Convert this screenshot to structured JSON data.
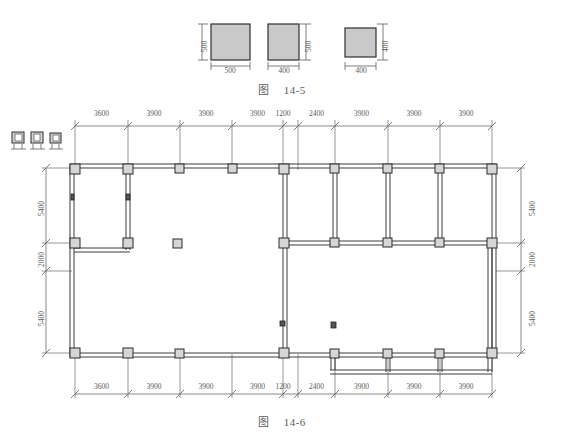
{
  "figures": [
    {
      "id": "fig-14-5",
      "caption_label": "图",
      "caption_number": "14-5",
      "squares": [
        {
          "name": "column-500x500",
          "width_label": "500",
          "height_label": "500"
        },
        {
          "name": "column-400x500",
          "width_label": "400",
          "height_label": "500"
        },
        {
          "name": "column-400x400",
          "width_label": "400",
          "height_label": "400"
        }
      ],
      "fill_color": "#c9c9c9",
      "stroke_color": "#2f2f2f"
    },
    {
      "id": "fig-14-6",
      "caption_label": "图",
      "caption_number": "14-6",
      "top_dimensions": [
        "3600",
        "3900",
        "3900",
        "3900",
        "1200",
        "2400",
        "3900",
        "3900",
        "3900"
      ],
      "bottom_dimensions": [
        "3600",
        "3900",
        "3900",
        "3900",
        "1200",
        "2400",
        "3900",
        "3900",
        "3900"
      ],
      "left_dimensions": [
        "5400",
        "2000",
        "5400"
      ],
      "right_dimensions": [
        "5400",
        "2000",
        "5400"
      ],
      "legend_symbols": [
        "column-type-1",
        "column-type-2",
        "column-type-3"
      ]
    }
  ]
}
